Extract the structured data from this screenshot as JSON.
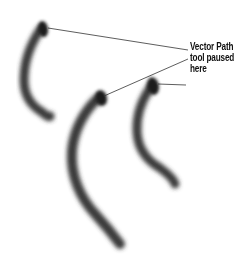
{
  "figure": {
    "background": "#ffffff",
    "stroke_color": "#2a2a2a",
    "leader_color": "#333333",
    "annotation": {
      "lines": [
        "Vector Path",
        "tool paused",
        "here"
      ]
    },
    "strokes": [
      {
        "name": "left-brush-stroke",
        "head": [
          43,
          28
        ]
      },
      {
        "name": "middle-brush-stroke",
        "head": [
          100,
          97
        ]
      },
      {
        "name": "right-brush-stroke",
        "head": [
          152,
          85
        ]
      }
    ]
  }
}
